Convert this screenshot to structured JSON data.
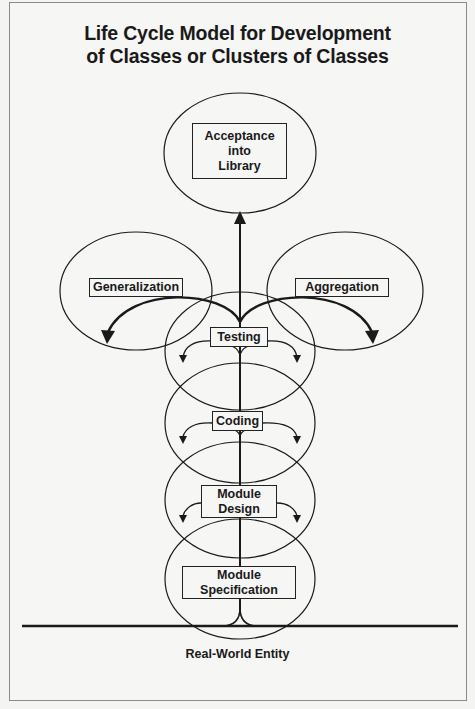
{
  "title": {
    "line1": "Life Cycle Model for Development",
    "line2": "of Classes or Clusters of Classes"
  },
  "stages": {
    "acceptance": "Acceptance\ninto\nLibrary",
    "generalization": "Generalization",
    "aggregation": "Aggregation",
    "testing": "Testing",
    "coding": "Coding",
    "module_design": "Module\nDesign",
    "module_specification": "Module\nSpecification"
  },
  "ground": {
    "label": "Real-World Entity"
  },
  "colors": {
    "background": "#f6f6f5",
    "ink": "#1a1a1a",
    "frame": "#8a8a8a"
  }
}
